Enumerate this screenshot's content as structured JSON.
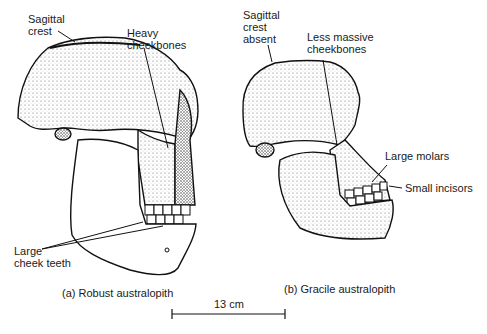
{
  "figure": {
    "skull_a": {
      "caption": "(a) Robust australopith",
      "labels": {
        "sagittal_crest": "Sagittal\ncrest",
        "heavy_cheekbones": "Heavy\ncheekbones",
        "large_cheek_teeth": "Large\ncheek teeth"
      }
    },
    "skull_b": {
      "caption": "(b) Gracile australopith",
      "labels": {
        "sagittal_crest_absent": "Sagittal\ncrest\nabsent",
        "less_massive_cheekbones": "Less massive\ncheekbones",
        "large_molars": "Large molars",
        "small_incisors": "Small incisors"
      }
    },
    "scale_bar": {
      "label": "13 cm"
    }
  }
}
